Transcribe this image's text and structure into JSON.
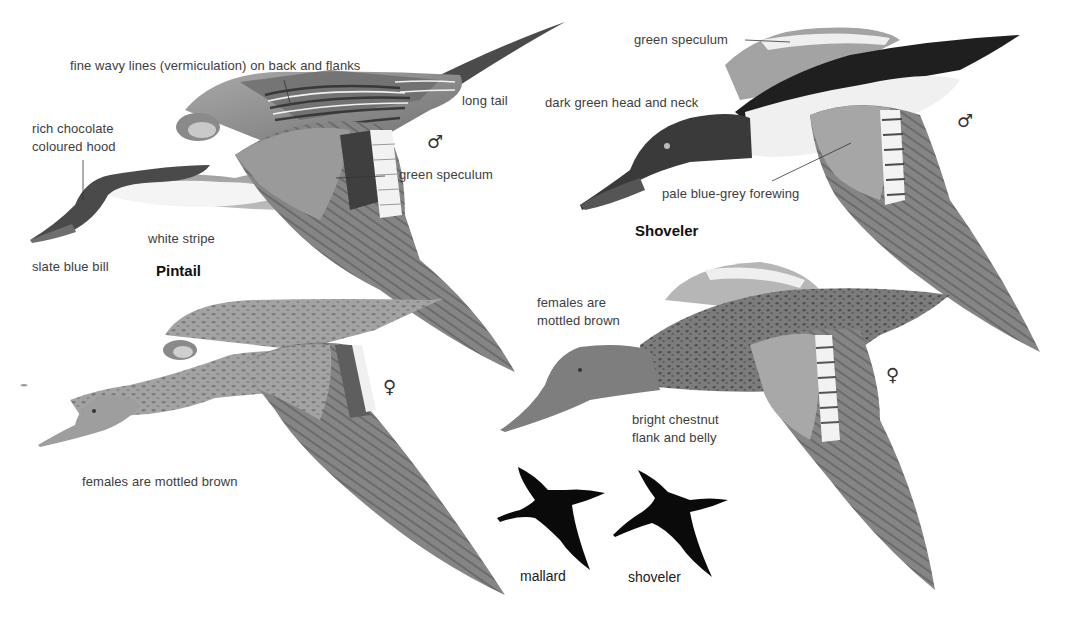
{
  "plate": {
    "pintail": {
      "name": "Pintail",
      "male": {
        "sex_symbol": "♂",
        "labels": {
          "vermiculation": "fine wavy lines (vermiculation) on back and flanks",
          "long_tail": "long tail",
          "hood": "rich chocolate\ncoloured hood",
          "speculum": "green speculum",
          "white_stripe": "white stripe",
          "bill": "slate blue bill"
        }
      },
      "female": {
        "sex_symbol": "♀",
        "labels": {
          "mottled": "females are mottled brown"
        }
      }
    },
    "shoveler": {
      "name": "Shoveler",
      "male": {
        "sex_symbol": "♂",
        "labels": {
          "speculum": "green speculum",
          "head": "dark green head and neck",
          "forewing": "pale blue-grey forewing"
        }
      },
      "female": {
        "sex_symbol": "♀",
        "labels": {
          "mottled": "females are\nmottled brown",
          "flank": "bright chestnut\nflank and belly"
        }
      }
    },
    "silhouettes": [
      {
        "label": "mallard"
      },
      {
        "label": "shoveler"
      }
    ],
    "colors": {
      "background": "#ffffff",
      "ink": "#3d3d3d",
      "silhouette": "#0a0a0a",
      "plumage_light": "#b8b8b8",
      "plumage_mid": "#8f8f8f",
      "plumage_dark": "#4a4a4a"
    }
  }
}
